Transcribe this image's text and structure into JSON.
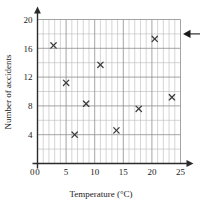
{
  "chart_data": {
    "type": "scatter",
    "title": "",
    "xlabel": "Temperature (°C)",
    "ylabel": "Number of accidents",
    "xlim": [
      0,
      25
    ],
    "ylim": [
      0,
      20
    ],
    "x_ticks": [
      0,
      5,
      10,
      15,
      20,
      25
    ],
    "y_ticks": [
      0,
      4,
      8,
      12,
      16,
      20
    ],
    "x_tick_labels": [
      "0",
      "5",
      "10",
      "15",
      "20",
      "25"
    ],
    "y_tick_labels": [
      "0",
      "4",
      "8",
      "12",
      "16",
      "20"
    ],
    "x_minor_step": 1,
    "y_minor_step": 2,
    "grid": true,
    "legend": "none",
    "marker_symbol": "x",
    "points": [
      {
        "x": 2.8,
        "y": 16.4
      },
      {
        "x": 5.0,
        "y": 11.2
      },
      {
        "x": 6.5,
        "y": 4.0
      },
      {
        "x": 8.5,
        "y": 8.3
      },
      {
        "x": 11.0,
        "y": 13.7
      },
      {
        "x": 13.8,
        "y": 4.6
      },
      {
        "x": 17.7,
        "y": 7.6
      },
      {
        "x": 20.5,
        "y": 17.3
      },
      {
        "x": 23.5,
        "y": 9.2
      }
    ],
    "annotations": [
      {
        "name": "left-pointing-arrow",
        "description": "arrow pointing left toward the plot at the 18 accidents level",
        "y_value": 18,
        "text": ""
      }
    ],
    "colors": {
      "marker": "#3b3b3b",
      "axis": "#2b2b2b",
      "grid_major": "#8d8d8d",
      "grid_minor": "#b9b9b9",
      "background": "#ffffff",
      "text": "#1a1a1a"
    }
  }
}
